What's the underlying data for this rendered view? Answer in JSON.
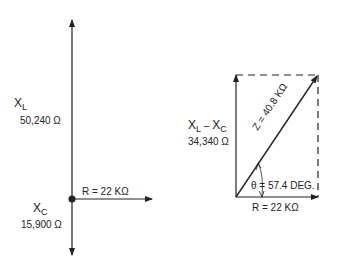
{
  "left_diagram": {
    "xl_symbol": "X",
    "xl_sub": "L",
    "xl_value": "50,240 Ω",
    "xc_symbol": "X",
    "xc_sub": "C",
    "xc_value": "15,900 Ω",
    "r_label": "R = 22 KΩ"
  },
  "right_diagram": {
    "diff_symbol_1": "X",
    "diff_sub_1": "L",
    "diff_minus": " – ",
    "diff_symbol_2": "X",
    "diff_sub_2": "C",
    "diff_value": "34,340 Ω",
    "z_label": "Z = 40.8 KΩ",
    "theta_label": "θ = 57.4 DEG.",
    "r_label": "R = 22 KΩ"
  }
}
